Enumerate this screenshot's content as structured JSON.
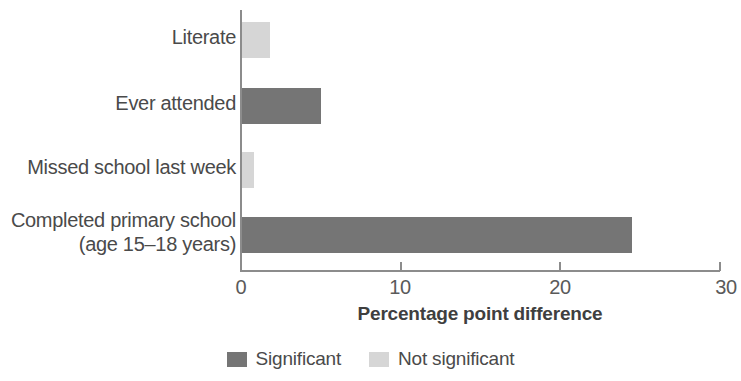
{
  "chart_data": {
    "type": "bar",
    "orientation": "horizontal",
    "title": "",
    "xlabel": "Percentage point difference",
    "ylabel": "",
    "xlim": [
      0,
      30
    ],
    "xticks": [
      0,
      10,
      20,
      30
    ],
    "xtick_labels": [
      "0",
      "10",
      "20",
      "30"
    ],
    "grid": false,
    "categories": [
      "Literate",
      "Ever attended",
      "Missed school last week",
      "Completed primary school\n(age 15–18 years)"
    ],
    "values": [
      1.8,
      5.0,
      0.8,
      24.5
    ],
    "point_significance": [
      "Not significant",
      "Significant",
      "Not significant",
      "Significant"
    ],
    "legend": {
      "position": "bottom",
      "entries": [
        {
          "label": "Significant",
          "color": "#757575"
        },
        {
          "label": "Not significant",
          "color": "#d6d6d6"
        }
      ]
    },
    "colors": {
      "significant": "#757575",
      "not_significant": "#d6d6d6",
      "axis": "#8c8c8c",
      "text": "#4a4a4a",
      "background": "#ffffff"
    }
  }
}
